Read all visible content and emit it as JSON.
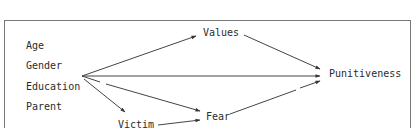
{
  "diagram": {
    "type": "path-model",
    "predictors": [
      {
        "id": "age",
        "label": "Age"
      },
      {
        "id": "gender",
        "label": "Gender"
      },
      {
        "id": "education",
        "label": "Education"
      },
      {
        "id": "parent",
        "label": "Parent"
      }
    ],
    "mediators": [
      {
        "id": "values",
        "label": "Values"
      },
      {
        "id": "fear",
        "label": "Fear"
      },
      {
        "id": "victim",
        "label": "Victim"
      }
    ],
    "outcome": {
      "id": "punitiveness",
      "label": "Punitiveness"
    },
    "edges": [
      {
        "from": "predictors",
        "to": "values",
        "style": "solid"
      },
      {
        "from": "predictors",
        "to": "punitiveness",
        "style": "solid"
      },
      {
        "from": "predictors",
        "to": "fear",
        "style": "dashed-start"
      },
      {
        "from": "predictors",
        "to": "victim",
        "style": "solid"
      },
      {
        "from": "victim",
        "to": "fear",
        "style": "solid"
      },
      {
        "from": "values",
        "to": "punitiveness",
        "style": "solid"
      },
      {
        "from": "fear",
        "to": "punitiveness",
        "style": "dashed-end"
      }
    ]
  }
}
